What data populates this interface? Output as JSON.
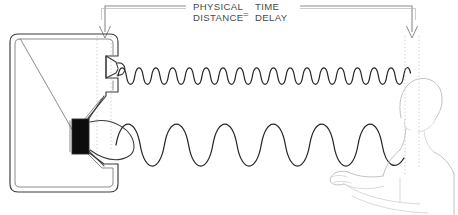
{
  "figure": {
    "title_equation": {
      "left_numerator": "PHYSICAL",
      "left_denominator": "DISTANCE",
      "equals": "=",
      "right_numerator": "TIME",
      "right_denominator": "DELAY"
    },
    "colors": {
      "background": "#ffffff",
      "ink": "#262626",
      "cabinet_outline": "#3a3a3a",
      "magnet_fill": "#0d0d0d",
      "leader_line": "#8c8c8c",
      "guide_dotted": "#c9c9c9",
      "person_outline": "#c2c2c2",
      "text": "#4a4a4a"
    },
    "leaders": {
      "left_arrow_x": 105,
      "right_arrow_x": 412,
      "arrow_label": "down-arrow",
      "left_guide_label": "speaker-baffle-reference",
      "right_guide_label": "listener-ear-reference"
    },
    "speaker": {
      "label": "loudspeaker-cabinet",
      "cabinet_shape": "rounded-rectangle",
      "drivers": [
        {
          "name": "tweeter",
          "position": "upper",
          "kind": "small-dome-driver"
        },
        {
          "name": "woofer",
          "position": "lower",
          "kind": "large-cone-driver-with-magnet"
        }
      ]
    },
    "waves": {
      "upper": {
        "name": "high-frequency-wave",
        "cycles": 14,
        "amplitude_px": 11,
        "baseline_y": 76,
        "start_x": 118,
        "end_x": 410,
        "source_driver": "tweeter"
      },
      "lower": {
        "name": "low-frequency-wave",
        "cycles": 5,
        "amplitude_px": 28,
        "baseline_y": 145,
        "start_x": 116,
        "end_x": 408,
        "source_driver": "woofer"
      }
    },
    "listener": {
      "label": "listener-figure",
      "parts": [
        "head",
        "neck",
        "shoulder",
        "torso",
        "upper-arm",
        "forearm",
        "hand"
      ],
      "facing": "left"
    }
  }
}
